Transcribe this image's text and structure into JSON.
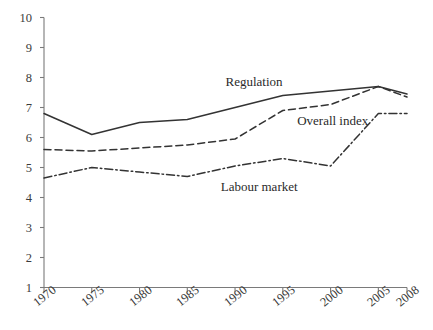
{
  "chart_data": {
    "type": "line",
    "title": "",
    "xlabel": "",
    "ylabel": "",
    "x": [
      1970,
      1975,
      1980,
      1985,
      1990,
      1995,
      2000,
      2005,
      2008
    ],
    "categories": [
      "1970",
      "1975",
      "1980",
      "1985",
      "1990",
      "1995",
      "2000",
      "2005",
      "2008"
    ],
    "xlim": [
      1970,
      2008
    ],
    "ylim": [
      1,
      10
    ],
    "ytick_labels": [
      "10",
      "9",
      "8",
      "7",
      "6",
      "5",
      "4",
      "3",
      "2",
      "1"
    ],
    "yticks": [
      10,
      9,
      8,
      7,
      6,
      5,
      4,
      3,
      2,
      1
    ],
    "grid": false,
    "legend_position": "inline-annotations",
    "series": [
      {
        "name": "Regulation",
        "style": "solid",
        "color": "#333333",
        "values": [
          6.8,
          6.1,
          6.5,
          6.6,
          7.0,
          7.4,
          7.55,
          7.7,
          7.45
        ]
      },
      {
        "name": "Overall index",
        "style": "dashed",
        "color": "#333333",
        "values": [
          5.6,
          5.55,
          5.65,
          5.75,
          5.95,
          6.9,
          7.1,
          7.7,
          7.35
        ]
      },
      {
        "name": "Labour market",
        "style": "dashdot",
        "color": "#333333",
        "values": [
          4.65,
          5.0,
          4.85,
          4.7,
          5.05,
          5.3,
          5.05,
          6.8,
          6.8
        ]
      }
    ],
    "annotations": [
      {
        "text": "Regulation",
        "x": 1989,
        "y": 7.85
      },
      {
        "text": "Overall index",
        "x": 1996.5,
        "y": 6.55
      },
      {
        "text": "Labour market",
        "x": 1988.5,
        "y": 4.35
      }
    ],
    "axis_color": "#7a7a7a",
    "text_color": "#3b3b3b"
  }
}
